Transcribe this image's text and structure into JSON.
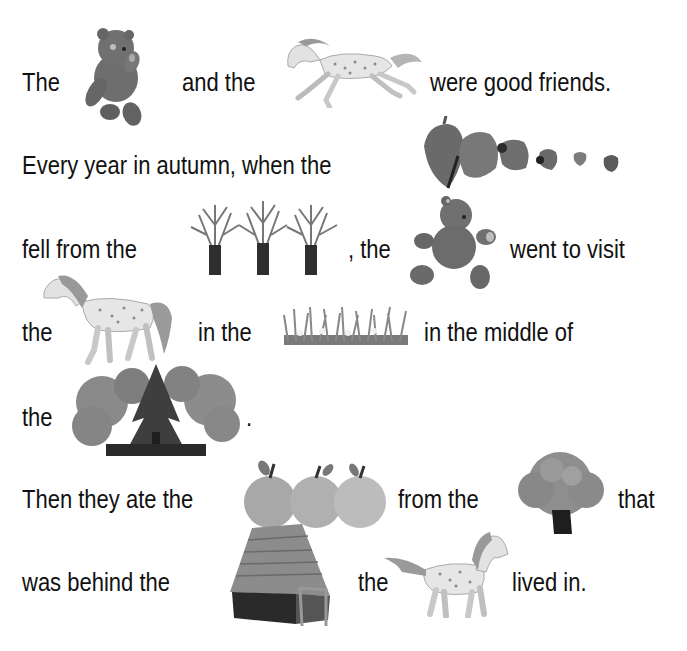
{
  "story": {
    "lines": [
      {
        "segments": [
          {
            "text": "The"
          },
          {
            "picture": "teddy-bear-sitting"
          },
          {
            "text": "and the"
          },
          {
            "picture": "spotted-horse-galloping"
          },
          {
            "text": "were good friends."
          }
        ]
      },
      {
        "segments": [
          {
            "text": "Every year in autumn, when the"
          },
          {
            "picture": "falling-leaves"
          }
        ]
      },
      {
        "segments": [
          {
            "text": "fell from the"
          },
          {
            "picture": "bare-trees"
          },
          {
            "text": ", the"
          },
          {
            "picture": "teddy-bear-running"
          },
          {
            "text": "went to visit"
          }
        ]
      },
      {
        "segments": [
          {
            "text": "the"
          },
          {
            "picture": "spotted-horse-walking"
          },
          {
            "text": "in the"
          },
          {
            "picture": "meadow-grass"
          },
          {
            "text": "in the middle of"
          }
        ]
      },
      {
        "segments": [
          {
            "text": "the"
          },
          {
            "picture": "forest"
          },
          {
            "text": "."
          }
        ]
      },
      {
        "segments": [
          {
            "text": "Then they ate the"
          },
          {
            "picture": "apples"
          },
          {
            "text": "from the"
          },
          {
            "picture": "apple-tree"
          },
          {
            "text": "that"
          }
        ]
      },
      {
        "segments": [
          {
            "text": "was behind the"
          },
          {
            "picture": "wooden-house"
          },
          {
            "text": "the"
          },
          {
            "picture": "spotted-horse-standing"
          },
          {
            "text": "lived in."
          }
        ]
      }
    ]
  },
  "colors": {
    "text": "#111111",
    "background": "#ffffff",
    "illustration_dark": "#3a3a3a",
    "illustration_mid": "#7a7a7a",
    "illustration_light": "#d8d8d8"
  }
}
